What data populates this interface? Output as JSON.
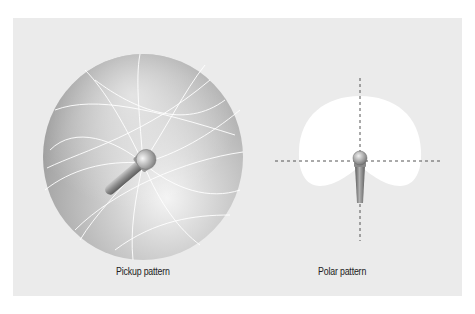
{
  "figures": [
    {
      "id": "pickup",
      "caption": "Pickup pattern",
      "icon": "sphere-pickup-pattern-with-microphone"
    },
    {
      "id": "polar",
      "caption": "Polar pattern",
      "icon": "cardioid-polar-pattern-with-microphone"
    }
  ],
  "colors": {
    "background": "#ebebeb",
    "polar_fill": "#ffffff",
    "axis_dash": "#555555",
    "sphere_light": "#f2f2f2",
    "sphere_dark": "#9a9a9a"
  }
}
